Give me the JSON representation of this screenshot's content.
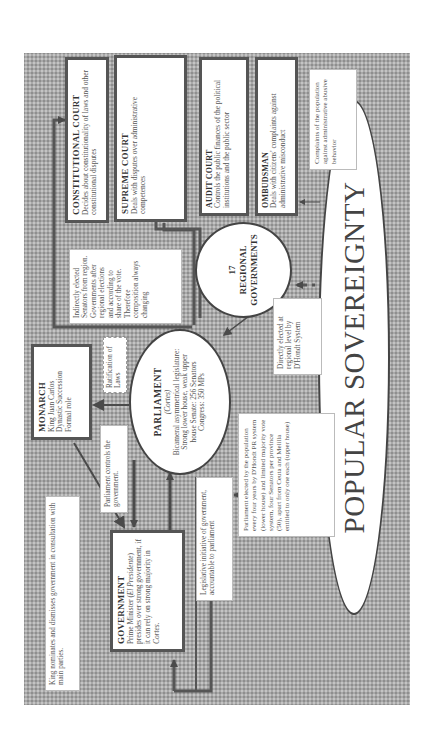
{
  "diagram": {
    "colors": {
      "background": "#a9a9a9",
      "box_fill": "#ffffff",
      "box_border": "#555555",
      "arrow": "#555555"
    },
    "nodes": {
      "constitutional_court": {
        "title": "CONSTITUTIONAL COURT",
        "text": "Decides about constitutionality of laws and other constitutional disputes"
      },
      "supreme_court": {
        "title": "SUPREME COURT",
        "text": "Deals with disputes over administrative competences"
      },
      "audit_court": {
        "title": "AUDIT COURT",
        "text": "Controls the public finances of the political institutions and the public sector"
      },
      "ombudsman": {
        "title": "OMBUDSMAN",
        "text": "Deals with citizens' complaints against administrative misconduct"
      },
      "regional_governments": {
        "count": "17",
        "title": "REGIONAL GOVERNMENTS"
      },
      "parliament": {
        "title": "PARLIAMENT",
        "subtitle": "(Cortes)",
        "text": "Bicameral asymmetrical legislature: Strong lower house, weak upper house Senate: 256 Senators Congress: 350 MPs"
      },
      "monarch": {
        "title": "MONARCH",
        "lines": [
          "King Juan Carlos",
          "Dynastic Succession",
          "Formal role"
        ]
      },
      "government": {
        "title": "GOVERNMENT",
        "text_1": "Prime Minister (",
        "text_italic": "El Presidente",
        "text_2": ") presides over strong government, if it can rely on strong majority in ",
        "text_italic_2": "Cortes."
      },
      "popular_sovereignty": {
        "title": "POPULAR SOVEREIGNTY"
      }
    },
    "annotations": {
      "complaints": "Complaints of the population against administrative abusive behavior",
      "indirectly_elected": "Indirectly elected Senators from region. Governments after regional elections and according to share of the vote. Therefore composition always changing",
      "directly_elected": "Directly elected at regional level by D'Hondt System",
      "ratification": "Ratification of Laws",
      "parliament_elected": "Parliament elected by the population every four years by D'Hondt PR system (lower house) and limited majority vote system, four Senators per province (50), apart from Ceuta and Melilla entitled to only one each (upper house)",
      "parliament_controls": "Parliament controls the government.",
      "legislative_initiative": "Legislative initiative of government, accountable to parliament",
      "king_nominates": "King nominates and dismisses government in consultation with main parties."
    }
  }
}
